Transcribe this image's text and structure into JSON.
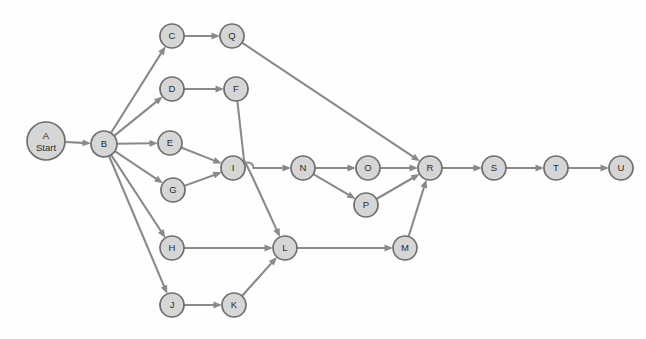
{
  "diagram": {
    "type": "directed-graph",
    "canvas": {
      "width": 646,
      "height": 339
    },
    "style": {
      "node_fill": "#d6d6d6",
      "node_stroke": "#6e6e6e",
      "edge_color": "#8a8a8a",
      "label_color": "#2b2b2b",
      "background": "#fefefe"
    },
    "nodes": [
      {
        "id": "A",
        "label": "A",
        "sublabel": "Start",
        "x": 46,
        "y": 141,
        "r": 19
      },
      {
        "id": "B",
        "label": "B",
        "sublabel": "",
        "x": 104,
        "y": 144,
        "r": 13
      },
      {
        "id": "C",
        "label": "C",
        "sublabel": "",
        "x": 172,
        "y": 36,
        "r": 12
      },
      {
        "id": "Q",
        "label": "Q",
        "sublabel": "",
        "x": 232,
        "y": 36,
        "r": 12
      },
      {
        "id": "D",
        "label": "D",
        "sublabel": "",
        "x": 172,
        "y": 89,
        "r": 12
      },
      {
        "id": "F",
        "label": "F",
        "sublabel": "",
        "x": 236,
        "y": 89,
        "r": 12
      },
      {
        "id": "E",
        "label": "E",
        "sublabel": "",
        "x": 170,
        "y": 143,
        "r": 12
      },
      {
        "id": "G",
        "label": "G",
        "sublabel": "",
        "x": 173,
        "y": 190,
        "r": 12
      },
      {
        "id": "I",
        "label": "I",
        "sublabel": "",
        "x": 233,
        "y": 168,
        "r": 12
      },
      {
        "id": "N",
        "label": "N",
        "sublabel": "",
        "x": 303,
        "y": 168,
        "r": 12
      },
      {
        "id": "O",
        "label": "O",
        "sublabel": "",
        "x": 368,
        "y": 168,
        "r": 12
      },
      {
        "id": "P",
        "label": "P",
        "sublabel": "",
        "x": 366,
        "y": 205,
        "r": 12
      },
      {
        "id": "R",
        "label": "R",
        "sublabel": "",
        "x": 430,
        "y": 168,
        "r": 12
      },
      {
        "id": "S",
        "label": "S",
        "sublabel": "",
        "x": 494,
        "y": 168,
        "r": 12
      },
      {
        "id": "T",
        "label": "T",
        "sublabel": "",
        "x": 556,
        "y": 168,
        "r": 12
      },
      {
        "id": "U",
        "label": "U",
        "sublabel": "",
        "x": 621,
        "y": 168,
        "r": 12
      },
      {
        "id": "H",
        "label": "H",
        "sublabel": "",
        "x": 172,
        "y": 248,
        "r": 12
      },
      {
        "id": "L",
        "label": "L",
        "sublabel": "",
        "x": 285,
        "y": 248,
        "r": 12
      },
      {
        "id": "M",
        "label": "M",
        "sublabel": "",
        "x": 405,
        "y": 248,
        "r": 12
      },
      {
        "id": "J",
        "label": "J",
        "sublabel": "",
        "x": 172,
        "y": 305,
        "r": 12
      },
      {
        "id": "K",
        "label": "K",
        "sublabel": "",
        "x": 234,
        "y": 305,
        "r": 12
      }
    ],
    "edges": [
      {
        "from": "A",
        "to": "B"
      },
      {
        "from": "B",
        "to": "C"
      },
      {
        "from": "B",
        "to": "D"
      },
      {
        "from": "B",
        "to": "E"
      },
      {
        "from": "B",
        "to": "G"
      },
      {
        "from": "B",
        "to": "H"
      },
      {
        "from": "B",
        "to": "J"
      },
      {
        "from": "C",
        "to": "Q"
      },
      {
        "from": "D",
        "to": "F"
      },
      {
        "from": "E",
        "to": "I"
      },
      {
        "from": "G",
        "to": "I"
      },
      {
        "from": "Q",
        "to": "R"
      },
      {
        "from": "F",
        "to": "L",
        "waypoints": [
          [
            244,
            160
          ],
          [
            252,
            176
          ]
        ]
      },
      {
        "from": "I",
        "to": "N",
        "hop_at": [
          248,
          168
        ]
      },
      {
        "from": "N",
        "to": "O"
      },
      {
        "from": "N",
        "to": "P"
      },
      {
        "from": "O",
        "to": "R"
      },
      {
        "from": "P",
        "to": "R"
      },
      {
        "from": "H",
        "to": "L"
      },
      {
        "from": "J",
        "to": "K"
      },
      {
        "from": "K",
        "to": "L"
      },
      {
        "from": "L",
        "to": "M"
      },
      {
        "from": "M",
        "to": "R"
      },
      {
        "from": "R",
        "to": "S"
      },
      {
        "from": "S",
        "to": "T"
      },
      {
        "from": "T",
        "to": "U"
      }
    ]
  }
}
